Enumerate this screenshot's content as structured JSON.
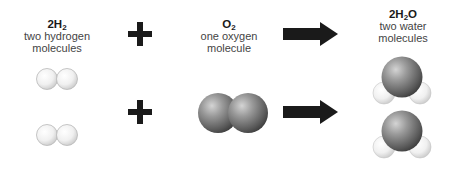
{
  "reactants": [
    {
      "id": "hydrogen",
      "formula_prefix": "2H",
      "formula_sub": "2",
      "formula_suffix": "",
      "desc_line1": "two hydrogen",
      "desc_line2": "molecules",
      "molecule_count": 2,
      "atom_color": "#eeeeee"
    },
    {
      "id": "oxygen",
      "formula_prefix": "O",
      "formula_sub": "2",
      "formula_suffix": "",
      "desc_line1": "one oxygen",
      "desc_line2": "molecule",
      "molecule_count": 1,
      "atom_color": "#7a7a7a"
    }
  ],
  "product": {
    "id": "water",
    "formula_prefix": "2H",
    "formula_sub": "2",
    "formula_suffix": "O",
    "desc_line1": "two water",
    "desc_line2": "molecules",
    "molecule_count": 2
  },
  "operators": {
    "plus": "+",
    "arrow": "→"
  },
  "colors": {
    "operator": "#1a1a1a",
    "hydrogen": "#eeeeee",
    "oxygen": "#6e6e6e",
    "background": "#ffffff"
  }
}
